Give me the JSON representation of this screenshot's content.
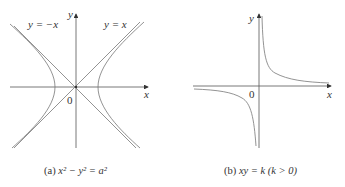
{
  "figure": {
    "panel_a": {
      "caption_prefix": "(a)",
      "caption_equation": "x² − y² = a²",
      "y_axis_label": "y",
      "x_axis_label": "x",
      "origin_label": "0",
      "asymptote_left_label": "y = −x",
      "asymptote_right_label": "y = x"
    },
    "panel_b": {
      "caption_prefix": "(b)",
      "caption_equation": "xy = k  (k > 0)",
      "y_axis_label": "y",
      "x_axis_label": "x",
      "origin_label": "0"
    },
    "colors": {
      "curve": "#777777",
      "axis": "#444444",
      "text": "#333333"
    }
  }
}
